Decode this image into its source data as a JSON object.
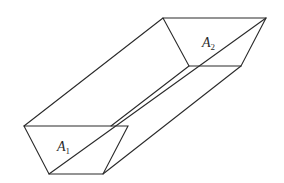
{
  "diagram": {
    "type": "trapezoidal channel / prism (perspective line drawing)",
    "labels": {
      "a1": {
        "letter": "A",
        "subscript": "1"
      },
      "a2": {
        "letter": "A",
        "subscript": "2"
      }
    },
    "stroke_color": "#2a2a2a",
    "background": "#ffffff"
  }
}
